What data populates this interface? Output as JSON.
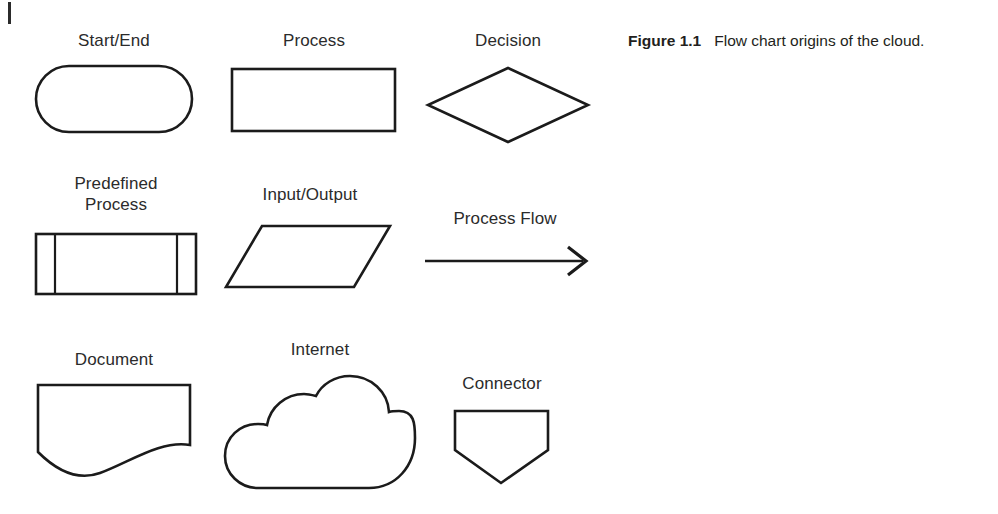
{
  "figure": {
    "number": "Figure 1.1",
    "text": "Flow chart origins of the cloud."
  },
  "shapes": [
    {
      "id": "start-end",
      "label": "Start/End"
    },
    {
      "id": "process",
      "label": "Process"
    },
    {
      "id": "decision",
      "label": "Decision"
    },
    {
      "id": "predefined-process",
      "label": "Predefined\nProcess"
    },
    {
      "id": "input-output",
      "label": "Input/Output"
    },
    {
      "id": "process-flow",
      "label": "Process Flow"
    },
    {
      "id": "document",
      "label": "Document"
    },
    {
      "id": "internet",
      "label": "Internet"
    },
    {
      "id": "connector",
      "label": "Connector"
    }
  ],
  "colors": {
    "background": "#ffffff",
    "stroke": "#1b1b1b",
    "label_text": "#2b2b2b",
    "caption_text": "#231f20"
  }
}
